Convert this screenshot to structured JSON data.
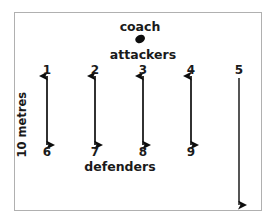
{
  "diagram": {
    "title_marker": "coach",
    "attackers_label": "attackers",
    "defenders_label": "defenders",
    "scale_label": "10 metres",
    "stroke_color": "#0d0d0d",
    "frame_color": "#b0b0b0",
    "background_color": "#ffffff",
    "top_positions": [
      {
        "label": "1",
        "x": 47,
        "y": 71
      },
      {
        "label": "2",
        "x": 95,
        "y": 71
      },
      {
        "label": "3",
        "x": 143,
        "y": 71
      },
      {
        "label": "4",
        "x": 191,
        "y": 71
      },
      {
        "label": "5",
        "x": 239,
        "y": 71
      }
    ],
    "bottom_positions": [
      {
        "label": "6",
        "x": 47,
        "y": 152
      },
      {
        "label": "7",
        "x": 95,
        "y": 152
      },
      {
        "label": "8",
        "x": 143,
        "y": 152
      },
      {
        "label": "9",
        "x": 191,
        "y": 152
      }
    ],
    "arrows": [
      {
        "name": "arrow-1-to-6",
        "x": 47,
        "y1": 76,
        "y2": 145,
        "heads": "both"
      },
      {
        "name": "arrow-2-to-7",
        "x": 95,
        "y1": 76,
        "y2": 145,
        "heads": "both"
      },
      {
        "name": "arrow-3-to-8",
        "x": 143,
        "y1": 76,
        "y2": 145,
        "heads": "both"
      },
      {
        "name": "arrow-4-to-9",
        "x": 191,
        "y1": 76,
        "y2": 145,
        "heads": "both"
      },
      {
        "name": "arrow-5-run",
        "x": 239,
        "y1": 78,
        "y2": 205,
        "heads": "down"
      }
    ],
    "coach_marker": {
      "x": 139,
      "y": 35
    },
    "coach_text": {
      "x": 140,
      "y": 21
    },
    "attackers_text": {
      "x": 143,
      "y": 49
    },
    "defenders_text": {
      "x": 120,
      "y": 161
    },
    "scale_text": {
      "x": 28,
      "y": 146
    }
  }
}
